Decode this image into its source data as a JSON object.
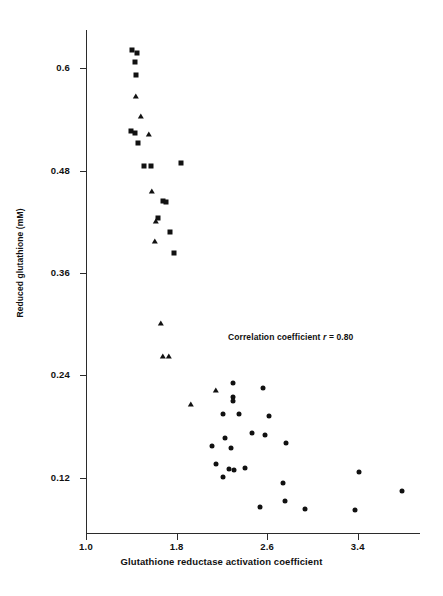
{
  "figure": {
    "background_color": "#ffffff",
    "marker_color": "#111111",
    "axis_color": "#2b2b2b"
  },
  "annotation": {
    "prefix": "Correlation coefficient",
    "variable": "r",
    "equals_value": "= 0.80",
    "full_text": "Correlation coefficient r = 0.80"
  },
  "chart_data": {
    "type": "scatter",
    "title": "",
    "xlabel": "Glutathione reductase activation coefficient",
    "ylabel": "Reduced glutathione (mM)",
    "xlim": [
      1.0,
      3.95
    ],
    "ylim": [
      0.055,
      0.645
    ],
    "xticks": [
      1.0,
      1.8,
      2.6,
      3.4
    ],
    "xticklabels": [
      "1.0",
      "1.8",
      "2.6",
      "3.4"
    ],
    "yticks": [
      0.12,
      0.24,
      0.36,
      0.48,
      0.6
    ],
    "yticklabels": [
      "0.12",
      "0.24",
      "0.36",
      "0.48",
      "0.6"
    ],
    "grid": false,
    "legend": "none",
    "annotations": [
      {
        "text": "Correlation coefficient r = 0.80",
        "x": 2.45,
        "y": 0.253
      }
    ],
    "series": [
      {
        "name": "squares",
        "marker": "square",
        "points": [
          [
            1.41,
            0.622
          ],
          [
            1.45,
            0.618
          ],
          [
            1.43,
            0.607
          ],
          [
            1.44,
            0.592
          ],
          [
            1.4,
            0.527
          ],
          [
            1.43,
            0.524
          ],
          [
            1.46,
            0.513
          ],
          [
            1.51,
            0.486
          ],
          [
            1.57,
            0.486
          ],
          [
            1.84,
            0.489
          ],
          [
            1.68,
            0.445
          ],
          [
            1.71,
            0.443
          ],
          [
            1.64,
            0.425
          ],
          [
            1.74,
            0.408
          ],
          [
            1.78,
            0.384
          ]
        ]
      },
      {
        "name": "triangles",
        "marker": "triangle",
        "points": [
          [
            1.44,
            0.566
          ],
          [
            1.49,
            0.543
          ],
          [
            1.56,
            0.522
          ],
          [
            1.58,
            0.455
          ],
          [
            1.62,
            0.42
          ],
          [
            1.61,
            0.396
          ],
          [
            1.66,
            0.3
          ],
          [
            1.68,
            0.262
          ],
          [
            1.73,
            0.262
          ],
          [
            1.93,
            0.205
          ],
          [
            2.15,
            0.222
          ]
        ]
      },
      {
        "name": "circles",
        "marker": "circle",
        "points": [
          [
            2.3,
            0.231
          ],
          [
            2.56,
            0.225
          ],
          [
            2.3,
            0.215
          ],
          [
            2.3,
            0.21
          ],
          [
            2.21,
            0.194
          ],
          [
            2.35,
            0.194
          ],
          [
            2.62,
            0.192
          ],
          [
            2.47,
            0.172
          ],
          [
            2.58,
            0.17
          ],
          [
            2.23,
            0.166
          ],
          [
            2.77,
            0.16
          ],
          [
            2.11,
            0.157
          ],
          [
            2.28,
            0.155
          ],
          [
            2.15,
            0.136
          ],
          [
            2.4,
            0.131
          ],
          [
            2.26,
            0.13
          ],
          [
            2.31,
            0.129
          ],
          [
            3.41,
            0.127
          ],
          [
            2.21,
            0.121
          ],
          [
            2.74,
            0.114
          ],
          [
            3.79,
            0.104
          ],
          [
            2.76,
            0.092
          ],
          [
            2.93,
            0.083
          ],
          [
            2.54,
            0.086
          ],
          [
            3.38,
            0.082
          ]
        ]
      }
    ]
  }
}
